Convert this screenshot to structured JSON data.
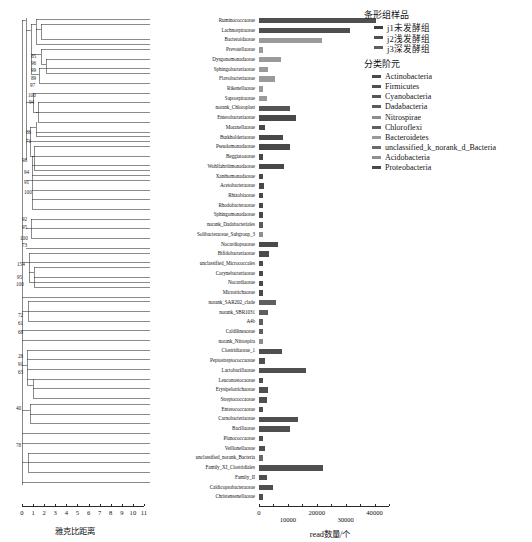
{
  "chart_data": {
    "type": "bar",
    "title": "",
    "xlabel": "read数量/个",
    "ylabel": "",
    "xlim": [
      0,
      45000
    ],
    "xticks": [
      0,
      10000,
      20000,
      30000,
      40000
    ],
    "xticklabels": [
      "0",
      "10000",
      "20000",
      "30000",
      "40000"
    ],
    "grid": false,
    "legend_position": "right",
    "bar_orientation": "horizontal",
    "stacked_groups": [
      "j1未发酵组",
      "j2浅发酵组",
      "j3深发酵组"
    ],
    "categories": [
      "Ruminococcaceae",
      "Lachnospiraceae",
      "Bacteroidaceae",
      "Prevotellaceae",
      "Dysgonomonadaceae",
      "Sphingobacteriaceae",
      "Flavobacteriaceae",
      "Rikenellaceae",
      "Saprospiraceae",
      "norank_Chloroplast",
      "Enterobacteriaceae",
      "Moraxellaceae",
      "Burkholderiaceae",
      "Pseudomonadaceae",
      "Beggiatoaceae",
      "Wohlfahrtiimonadaceae",
      "Xanthomonadaceae",
      "Acetobacteraceae",
      "Rhizobiaceae",
      "Rhodobacteraceae",
      "Sphingomonadaceae",
      "norank_Dadabacteriales",
      "Solibacteraceae_Subgroup_3",
      "Nocardiopsaceae",
      "Bifidobacteriaceae",
      "unclassified_Micrococcales",
      "Corynebacteriaceae",
      "Nocardiaceae",
      "Microtrichaceae",
      "norank_SAR202_clade",
      "norank_SBR1031",
      "A4b",
      "Caldilineaceae",
      "norank_Nitrospira",
      "Clostridiaceae_1",
      "Peptostreptococcaceae",
      "Lactobacillaceae",
      "Leuconostocaceae",
      "Erysipelotrichaceae",
      "Streptococcaceae",
      "Enterococcaceae",
      "Carnobacteriaceae",
      "Bacillaceae",
      "Planococcaceae",
      "Veillonellaceae",
      "unclassified_norank_Bacteria",
      "Family_XI_Clostridiales",
      "Family_II",
      "Caldicoprobacteraceae",
      "Christensenellaceae"
    ],
    "values": [
      44000,
      34000,
      23500,
      1600,
      8200,
      3400,
      6000,
      1500,
      3000,
      11500,
      13800,
      2200,
      9000,
      11600,
      1500,
      9200,
      1500,
      2000,
      1600,
      1500,
      1500,
      1500,
      1500,
      7000,
      3600,
      1500,
      1500,
      1500,
      1500,
      6400,
      3400,
      1400,
      1500,
      1500,
      8600,
      2100,
      17600,
      1600,
      3400,
      3000,
      1500,
      14500,
      11800,
      1400,
      2200,
      1500,
      24000,
      3000,
      5400,
      1500
    ],
    "phyla": [
      "Firmicutes",
      "Firmicutes",
      "Bacteroidetes",
      "Bacteroidetes",
      "Bacteroidetes",
      "Bacteroidetes",
      "Bacteroidetes",
      "Bacteroidetes",
      "Bacteroidetes",
      "Cyanobacteria",
      "Proteobacteria",
      "Proteobacteria",
      "Proteobacteria",
      "Proteobacteria",
      "Proteobacteria",
      "Proteobacteria",
      "Proteobacteria",
      "Proteobacteria",
      "Proteobacteria",
      "Proteobacteria",
      "Proteobacteria",
      "Dadabacteria",
      "Acidobacteria",
      "Actinobacteria",
      "Actinobacteria",
      "Actinobacteria",
      "Actinobacteria",
      "Actinobacteria",
      "Actinobacteria",
      "Chloroflexi",
      "Chloroflexi",
      "Chloroflexi",
      "Chloroflexi",
      "Nitrospirae",
      "Firmicutes",
      "Firmicutes",
      "Firmicutes",
      "Firmicutes",
      "Firmicutes",
      "Firmicutes",
      "Firmicutes",
      "Firmicutes",
      "Firmicutes",
      "Firmicutes",
      "Firmicutes",
      "unclassified_k_norank_d_Bacteria",
      "Firmicutes",
      "Firmicutes",
      "Firmicutes",
      "Firmicutes"
    ]
  },
  "legend": {
    "group_title": "条形组样品",
    "groups": [
      {
        "label": "j1未发酵组",
        "color": "#3f3f3f"
      },
      {
        "label": "j2浅发酵组",
        "color": "#4f4f4f"
      },
      {
        "label": "j3深发酵组",
        "color": "#5e5e5e"
      }
    ],
    "rank_title": "分类阶元",
    "phyla": [
      {
        "label": "Actinobacteria",
        "color": "#4a4a4a"
      },
      {
        "label": "Firmicutes",
        "color": "#4f4f4f"
      },
      {
        "label": "Cyanobacteria",
        "color": "#555555"
      },
      {
        "label": "Dadabacteria",
        "color": "#5b5b5b"
      },
      {
        "label": "Nitrospirae",
        "color": "#8d8d8d"
      },
      {
        "label": "Chloroflexi",
        "color": "#5f5f5f"
      },
      {
        "label": "Bacteroidetes",
        "color": "#9a9a9a"
      },
      {
        "label": "unclassified_k_norank_d_Bacteria",
        "color": "#6a6a6a"
      },
      {
        "label": "Acidobacteria",
        "color": "#8f8f8f"
      },
      {
        "label": "Proteobacteria",
        "color": "#484848"
      }
    ]
  },
  "axes": {
    "left": {
      "title": "雅克比距离",
      "ticks": [
        "0",
        "1",
        "2",
        "3",
        "4",
        "5",
        "6",
        "7",
        "8",
        "9",
        "10",
        "11"
      ],
      "min": 0,
      "max": 11
    },
    "right": {
      "title": "read数量/个",
      "ticks": [
        "0",
        "10000",
        "20000",
        "30000",
        "40000"
      ],
      "min": 0,
      "max": 45000
    }
  },
  "dendrogram": {
    "support_values": [
      "85",
      "96",
      "99",
      "89",
      "97",
      "100",
      "94",
      "86",
      "71",
      "98",
      "94",
      "91",
      "100",
      "92",
      "95",
      "100",
      "73",
      "154",
      "95",
      "100",
      "72",
      "61",
      "68",
      "28",
      "91",
      "63",
      "40",
      "78"
    ]
  }
}
